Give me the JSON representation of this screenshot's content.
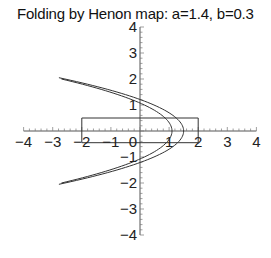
{
  "chart_data": {
    "type": "line",
    "title": "Folding by Henon map: a=1.4, b=0.3",
    "xlabel": "",
    "ylabel": "",
    "xlim": [
      -4,
      4
    ],
    "ylim": [
      -4,
      4
    ],
    "grid": false,
    "legend": null,
    "x_ticks": [
      -4,
      -3,
      -2,
      -1,
      0,
      1,
      2,
      3,
      4
    ],
    "y_ticks": [
      -4,
      -3,
      -2,
      -1,
      1,
      2,
      3,
      4
    ],
    "x_tick_labels": [
      "−4",
      "−3",
      "−2",
      "−1",
      "0",
      "1",
      "2",
      "3",
      "4"
    ],
    "y_tick_labels": [
      "−4",
      "−3",
      "−2",
      "−1",
      "1",
      "2",
      "3",
      "4"
    ],
    "series": [
      {
        "name": "initial rectangle",
        "shape": "rectangle",
        "x": [
          -2,
          2,
          2,
          -2,
          -2
        ],
        "y": [
          0.5,
          0.5,
          -0.45,
          -0.45,
          0.5
        ]
      },
      {
        "name": "folded image (inner edge)",
        "shape": "parabola",
        "vertex_x": 1.1,
        "curvature": 0.95,
        "y_range": [
          -2.0,
          2.0
        ]
      },
      {
        "name": "folded image (outer edge)",
        "shape": "parabola",
        "vertex_x": 1.5,
        "curvature": 1.02,
        "y_range": [
          -2.05,
          2.05
        ]
      }
    ]
  }
}
